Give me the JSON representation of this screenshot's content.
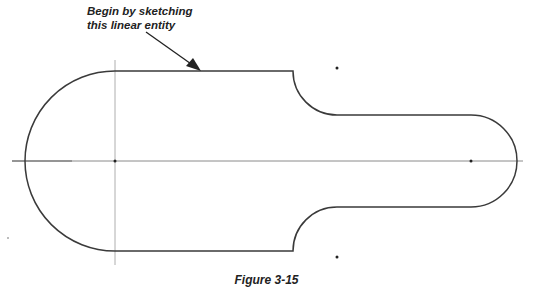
{
  "annotation": {
    "line1": "Begin by sketching",
    "line2": "this linear entity"
  },
  "caption": "Figure 3-15",
  "colors": {
    "profile": "#3a3a3a",
    "centerline": "#9a9a9a",
    "background": "#ffffff"
  }
}
